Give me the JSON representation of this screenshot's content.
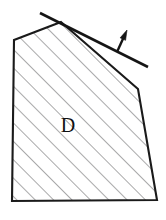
{
  "figure": {
    "kind": "geometry-diagram",
    "width": 166,
    "height": 220,
    "background_color": "#ffffff",
    "region": {
      "label": "D",
      "label_x": 68,
      "label_y": 127,
      "outline_color": "#1a1a1a",
      "outline_width": 2.1,
      "fill_color": "#ffffff",
      "vertices": [
        {
          "name": "apex-top",
          "x": 61,
          "y": 22
        },
        {
          "name": "right-shoulder",
          "x": 138,
          "y": 89
        },
        {
          "name": "bottom-right",
          "x": 157,
          "y": 200
        },
        {
          "name": "bottom-left",
          "x": 12,
          "y": 201
        },
        {
          "name": "left-shoulder",
          "x": 14,
          "y": 40
        }
      ],
      "hatching": {
        "color": "#59595c",
        "width": 1.05,
        "angle_degrees": 45,
        "spacing": 13,
        "direction": "bottom-left-to-top-right"
      }
    },
    "tangent_line": {
      "name": "tangent-line",
      "color": "#151515",
      "width": 2.6,
      "x1": 40,
      "y1": 13,
      "x2": 148,
      "y2": 67
    },
    "normal_arrow": {
      "name": "normal-arrow",
      "color": "#151515",
      "width": 2.4,
      "x1": 117,
      "y1": 52,
      "x2": 127,
      "y2": 30,
      "head_length": 10,
      "head_width": 6
    }
  }
}
